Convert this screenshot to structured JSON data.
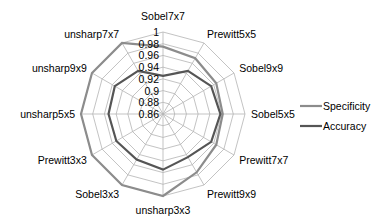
{
  "chart_data": {
    "type": "radar",
    "title": "",
    "categories": [
      "Sobel7x7",
      "Prewitt5x5",
      "Sobel9x9",
      "Sobel5x5",
      "Prewitt7x7",
      "Prewitt9x9",
      "unsharp3x3",
      "Sobel3x3",
      "Prewitt3x3",
      "unsharp5x5",
      "unsharp9x9",
      "unsharp7x7"
    ],
    "series": [
      {
        "name": "Specificity",
        "color": "#8c8c8c",
        "values": [
          0.975,
          0.97,
          0.965,
          0.962,
          0.965,
          0.975,
          1.0,
          1.0,
          1.0,
          1.0,
          1.0,
          1.0
        ]
      },
      {
        "name": "Accuracy",
        "color": "#555555",
        "values": [
          0.925,
          0.945,
          0.955,
          0.958,
          0.955,
          0.945,
          0.955,
          0.95,
          0.952,
          0.953,
          0.955,
          0.945
        ]
      }
    ],
    "rlim": [
      0.86,
      1.0
    ],
    "rticks": [
      0.86,
      0.88,
      0.9,
      0.92,
      0.94,
      0.96,
      0.98,
      1
    ],
    "rtick_labels": [
      "0.86",
      "0.88",
      "0.9",
      "0.92",
      "0.94",
      "0.96",
      "0.98",
      "1"
    ],
    "grid": true,
    "legend_position": "right"
  }
}
